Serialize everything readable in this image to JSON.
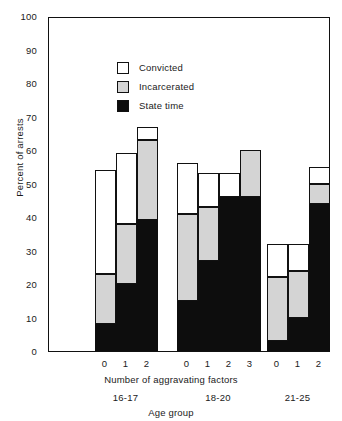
{
  "chart_data": {
    "type": "bar",
    "subtype": "overlapping-stacked-bars",
    "title": "",
    "xlabel": "Number of aggravating factors",
    "ylabel": "Percent of arrests",
    "group_axis_label": "Age group",
    "ylim": [
      0,
      100
    ],
    "y_ticks": [
      0,
      10,
      20,
      30,
      40,
      50,
      60,
      70,
      80,
      90,
      100
    ],
    "grid": false,
    "legend_position": "inside-top-left",
    "legend": [
      {
        "name": "Convicted",
        "color": "#ffffff"
      },
      {
        "name": "Incarcerated",
        "color": "#d4d4d4"
      },
      {
        "name": "State time",
        "color": "#0d0d0d"
      }
    ],
    "series": [
      {
        "name": "Convicted",
        "values": [
          54,
          59,
          67,
          56,
          53,
          53,
          60,
          32,
          32,
          55
        ]
      },
      {
        "name": "Incarcerated",
        "values": [
          23,
          38,
          63,
          41,
          43,
          46,
          60,
          22,
          24,
          50
        ]
      },
      {
        "name": "State time",
        "values": [
          8,
          20,
          39,
          15,
          27,
          46,
          46,
          3,
          10,
          44
        ]
      }
    ],
    "groups": [
      {
        "label": "16-17",
        "categories": [
          "0",
          "1",
          "2"
        ],
        "bars": [
          {
            "category": "0",
            "convicted": 54,
            "incarcerated": 23,
            "state_time": 8
          },
          {
            "category": "1",
            "convicted": 59,
            "incarcerated": 38,
            "state_time": 20
          },
          {
            "category": "2",
            "convicted": 67,
            "incarcerated": 63,
            "state_time": 39
          }
        ]
      },
      {
        "label": "18-20",
        "categories": [
          "0",
          "1",
          "2",
          "3"
        ],
        "bars": [
          {
            "category": "0",
            "convicted": 56,
            "incarcerated": 41,
            "state_time": 15
          },
          {
            "category": "1",
            "convicted": 53,
            "incarcerated": 43,
            "state_time": 27
          },
          {
            "category": "2",
            "convicted": 53,
            "incarcerated": 46,
            "state_time": 46
          },
          {
            "category": "3",
            "convicted": 60,
            "incarcerated": 60,
            "state_time": 46
          }
        ]
      },
      {
        "label": "21-25",
        "categories": [
          "0",
          "1",
          "2"
        ],
        "bars": [
          {
            "category": "0",
            "convicted": 32,
            "incarcerated": 22,
            "state_time": 3
          },
          {
            "category": "1",
            "convicted": 32,
            "incarcerated": 24,
            "state_time": 10
          },
          {
            "category": "2",
            "convicted": 55,
            "incarcerated": 50,
            "state_time": 44
          }
        ]
      }
    ]
  },
  "axis": {
    "y_tick_labels": [
      "100",
      "90",
      "80",
      "70",
      "60",
      "50",
      "40",
      "30",
      "20",
      "10",
      "0"
    ],
    "y_title": "Percent of arrests",
    "x_title": "Number of aggravating factors",
    "group_title": "Age group"
  }
}
